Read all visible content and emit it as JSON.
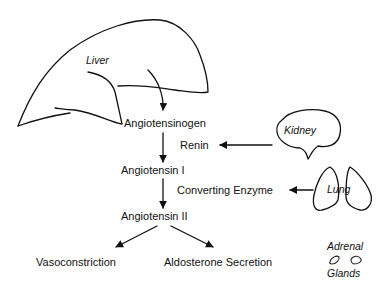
{
  "organs": {
    "liver": "Liver",
    "kidney": "Kidney",
    "lung": "Lung",
    "adrenal_top": "Adrenal",
    "adrenal_bottom": "Glands"
  },
  "pathway": {
    "step1": "Angiotensinogen",
    "enzyme1": "Renin",
    "step2": "Angiotensin I",
    "enzyme2": "Converting Enzyme",
    "step3": "Angiotensin II"
  },
  "effects": {
    "left": "Vasoconstriction",
    "right": "Aldosterone Secretion"
  },
  "colors": {
    "ink": "#111111",
    "background": "#ffffff"
  }
}
